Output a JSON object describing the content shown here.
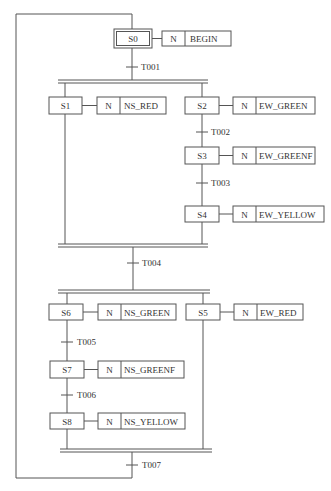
{
  "diagram": {
    "type": "sequential-function-chart",
    "colors": {
      "line": "#555555",
      "text": "#333333",
      "background": "#ffffff"
    },
    "steps": [
      {
        "id": "S0",
        "initial": true,
        "qualifier": "N",
        "action": "BEGIN"
      },
      {
        "id": "S1",
        "qualifier": "N",
        "action": "NS_RED"
      },
      {
        "id": "S2",
        "qualifier": "N",
        "action": "EW_GREEN"
      },
      {
        "id": "S3",
        "qualifier": "N",
        "action": "EW_GREENF"
      },
      {
        "id": "S4",
        "qualifier": "N",
        "action": "EW_YELLOW"
      },
      {
        "id": "S6",
        "qualifier": "N",
        "action": "NS_GREEN"
      },
      {
        "id": "S5",
        "qualifier": "N",
        "action": "EW_RED"
      },
      {
        "id": "S7",
        "qualifier": "N",
        "action": "NS_GREENF"
      },
      {
        "id": "S8",
        "qualifier": "N",
        "action": "NS_YELLOW"
      }
    ],
    "transitions": [
      {
        "id": "T001"
      },
      {
        "id": "T002"
      },
      {
        "id": "T003"
      },
      {
        "id": "T004"
      },
      {
        "id": "T005"
      },
      {
        "id": "T006"
      },
      {
        "id": "T007"
      }
    ]
  }
}
